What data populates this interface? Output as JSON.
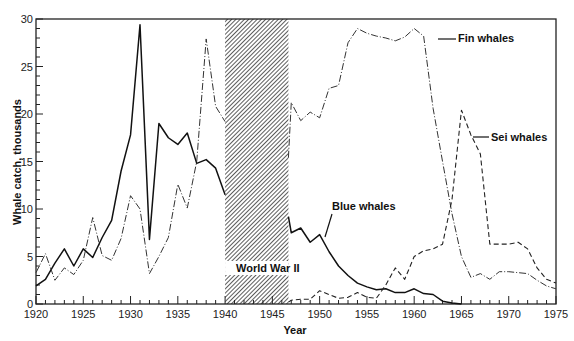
{
  "chart_data": {
    "type": "line",
    "title": "",
    "xlabel": "Year",
    "ylabel": "Whale catch, thousands",
    "xlim": [
      1920,
      1975
    ],
    "ylim": [
      0,
      30
    ],
    "x_ticks": [
      1920,
      1925,
      1930,
      1935,
      1940,
      1945,
      1950,
      1955,
      1960,
      1965,
      1970,
      1975
    ],
    "y_ticks": [
      0,
      5,
      10,
      15,
      20,
      25,
      30
    ],
    "grid": false,
    "legend": "inline labels",
    "annotations": [
      {
        "text": "World  War II",
        "type": "shaded-region",
        "x_range": [
          1940,
          1946.7
        ]
      }
    ],
    "series": [
      {
        "name": "Blue whales",
        "style": "solid",
        "x": [
          1920,
          1921,
          1922,
          1923,
          1924,
          1925,
          1926,
          1927,
          1928,
          1929,
          1930,
          1931,
          1932,
          1933,
          1934,
          1935,
          1936,
          1937,
          1938,
          1939,
          1940,
          1946.7,
          1947,
          1948,
          1949,
          1950,
          1951,
          1952,
          1953,
          1954,
          1955,
          1956,
          1957,
          1958,
          1959,
          1960,
          1961,
          1962,
          1963,
          1964,
          1965
        ],
        "values": [
          1.9,
          2.6,
          4.3,
          5.8,
          4.0,
          5.8,
          4.9,
          7.0,
          8.8,
          14.0,
          17.8,
          29.4,
          6.8,
          19.0,
          17.5,
          16.8,
          18.0,
          14.8,
          15.2,
          14.3,
          11.5,
          9.2,
          7.5,
          8.0,
          6.5,
          7.3,
          5.5,
          4.0,
          3.0,
          2.2,
          1.8,
          1.5,
          1.6,
          1.2,
          1.2,
          1.6,
          1.1,
          1.0,
          0.3,
          0.1,
          0.0
        ]
      },
      {
        "name": "Fin whales",
        "style": "dash-dot",
        "x": [
          1920,
          1921,
          1922,
          1923,
          1924,
          1925,
          1926,
          1927,
          1928,
          1929,
          1930,
          1931,
          1932,
          1933,
          1934,
          1935,
          1936,
          1937,
          1938,
          1939,
          1940,
          1946.7,
          1947,
          1948,
          1949,
          1950,
          1951,
          1952,
          1953,
          1954,
          1955,
          1956,
          1957,
          1958,
          1959,
          1960,
          1961,
          1962,
          1963,
          1964,
          1965,
          1966,
          1967,
          1968,
          1969,
          1970,
          1971,
          1972,
          1973,
          1974,
          1975
        ],
        "values": [
          3.3,
          5.3,
          2.5,
          3.8,
          3.1,
          4.6,
          9.1,
          5.1,
          4.6,
          6.9,
          11.4,
          10.0,
          3.2,
          5.0,
          7.0,
          12.6,
          10.1,
          15.0,
          27.9,
          20.8,
          19.2,
          15.4,
          21.2,
          19.3,
          20.2,
          19.6,
          22.7,
          23.0,
          27.5,
          29.0,
          28.5,
          28.2,
          28.0,
          27.7,
          28.1,
          29.0,
          28.2,
          20.6,
          15.0,
          9.5,
          5.0,
          2.8,
          3.2,
          2.6,
          3.4,
          3.4,
          3.3,
          3.2,
          2.5,
          1.9,
          1.6
        ]
      },
      {
        "name": "Sei whales",
        "style": "dashed",
        "x": [
          1946.7,
          1947,
          1948,
          1949,
          1950,
          1951,
          1952,
          1953,
          1954,
          1955,
          1956,
          1957,
          1958,
          1959,
          1960,
          1961,
          1962,
          1963,
          1964,
          1965,
          1966,
          1967,
          1968,
          1969,
          1970,
          1971,
          1972,
          1973,
          1974,
          1975
        ],
        "values": [
          0.2,
          0.4,
          0.5,
          0.5,
          1.4,
          1.0,
          0.6,
          0.7,
          1.2,
          0.7,
          0.6,
          2.0,
          3.8,
          2.6,
          5.0,
          5.6,
          5.8,
          6.3,
          11.0,
          20.4,
          17.8,
          15.8,
          6.3,
          6.3,
          6.3,
          6.5,
          5.8,
          3.8,
          2.6,
          2.2
        ]
      }
    ],
    "series_labels": {
      "blue": "Blue whales",
      "fin": "Fin whales",
      "sei": "Sei whales",
      "war": "World  War II"
    }
  }
}
